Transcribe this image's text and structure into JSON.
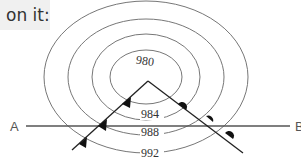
{
  "caption": {
    "text": "on it:"
  },
  "diagram": {
    "type": "weather-map",
    "low_center": {
      "x": 146,
      "y": 77
    },
    "isobars": [
      {
        "label": "980",
        "rx": 36,
        "ry": 27
      },
      {
        "label": "984",
        "rx": 54,
        "ry": 43
      },
      {
        "label": "988",
        "rx": 78,
        "ry": 58
      },
      {
        "label": "992",
        "rx": 102,
        "ry": 76
      }
    ],
    "fronts": {
      "cold_front": {
        "name": "cold front",
        "symbol": "triangles"
      },
      "warm_front": {
        "name": "warm front",
        "symbol": "semicircles"
      }
    },
    "section_line": {
      "start_label": "A",
      "end_label": "B"
    },
    "colors": {
      "line": "#555555",
      "front": "#222222",
      "caption_bg": "#f0f0f0"
    }
  }
}
